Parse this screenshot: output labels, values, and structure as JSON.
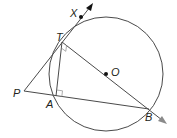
{
  "diagram": {
    "type": "geometry",
    "colors": {
      "stroke": "#4a4a4a",
      "point": "#111111",
      "text": "#231f20",
      "right_angle": "#8a8a8a"
    },
    "circle": {
      "center_label": "O",
      "cx": 106,
      "cy": 74,
      "r": 57
    },
    "points": {
      "X": {
        "label": "X",
        "x": 81,
        "y": 17
      },
      "T": {
        "label": "T",
        "x": 62,
        "y": 42
      },
      "O": {
        "label": "O",
        "x": 106,
        "y": 74
      },
      "P": {
        "label": "P",
        "x": 24,
        "y": 91
      },
      "A": {
        "label": "A",
        "x": 56,
        "y": 96
      },
      "B": {
        "label": "B",
        "x": 149,
        "y": 109
      }
    },
    "segments": [
      "PX (ray through T, X)",
      "PB (through A)",
      "TB (ray through O)",
      "TA"
    ],
    "right_angles": [
      "at T (angle ATB)",
      "at A (angle TAB)"
    ]
  }
}
